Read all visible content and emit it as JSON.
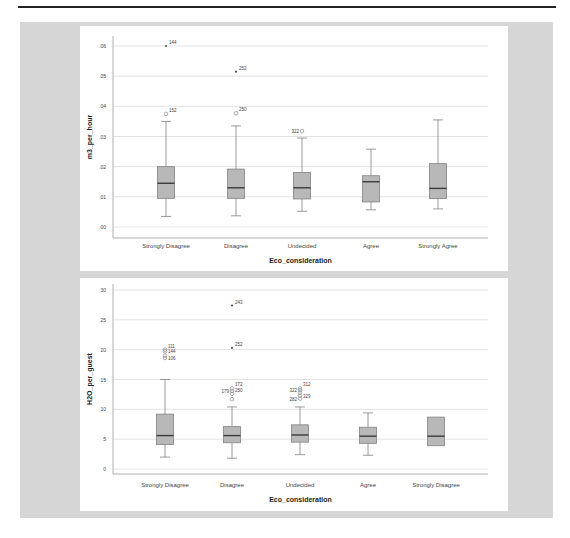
{
  "chart_data": [
    {
      "type": "boxplot",
      "title": "",
      "xlabel": "Eco_consideration",
      "ylabel": "m3_per_hour",
      "yticks": [
        ".00",
        ".01",
        ".02",
        ".03",
        ".04",
        ".05",
        ".06"
      ],
      "ylim": [
        -0.002,
        0.062
      ],
      "grid": true,
      "categories": [
        "Strongly Disagree",
        "Disagree",
        "Undecided",
        "Agree",
        "Strongly Agree"
      ],
      "boxes": [
        {
          "min": 0.0035,
          "q1": 0.0095,
          "median": 0.0145,
          "q3": 0.02,
          "max": 0.035,
          "outliers": [
            {
              "value": 0.0375,
              "label": "152",
              "type": "circle"
            },
            {
              "value": 0.06,
              "label": "144",
              "type": "star"
            }
          ]
        },
        {
          "min": 0.0037,
          "q1": 0.0095,
          "median": 0.013,
          "q3": 0.0192,
          "max": 0.0335,
          "outliers": [
            {
              "value": 0.0377,
              "label": "250",
              "type": "circle"
            },
            {
              "value": 0.0515,
              "label": "252",
              "type": "star"
            }
          ]
        },
        {
          "min": 0.0052,
          "q1": 0.0093,
          "median": 0.013,
          "q3": 0.0181,
          "max": 0.0295,
          "outliers": [
            {
              "value": 0.0318,
              "label": "322",
              "type": "circle"
            }
          ]
        },
        {
          "min": 0.0057,
          "q1": 0.0083,
          "median": 0.015,
          "q3": 0.017,
          "max": 0.0258,
          "outliers": []
        },
        {
          "min": 0.006,
          "q1": 0.0094,
          "median": 0.0128,
          "q3": 0.021,
          "max": 0.0355,
          "outliers": []
        }
      ]
    },
    {
      "type": "boxplot",
      "title": "",
      "xlabel": "Eco_consideration",
      "ylabel": "H2O_per_guest",
      "yticks": [
        "0",
        "5",
        "10",
        "15",
        "20",
        "25",
        "30"
      ],
      "ylim": [
        -1.5,
        31.5
      ],
      "grid": true,
      "categories": [
        "Strongly Disagree",
        "Disagree",
        "Undecided",
        "Agree",
        "Strongly Disagree"
      ],
      "boxes": [
        {
          "min": 2.0,
          "q1": 4.1,
          "median": 5.6,
          "q3": 9.2,
          "max": 15.0,
          "outliers": [
            {
              "value": 18.6,
              "label": "106",
              "type": "circle"
            },
            {
              "value": 19.0,
              "label": "",
              "type": "circle"
            },
            {
              "value": 19.7,
              "label": "144",
              "type": "circle"
            },
            {
              "value": 20.0,
              "label": "111",
              "type": "circle"
            }
          ]
        },
        {
          "min": 1.8,
          "q1": 4.4,
          "median": 5.6,
          "q3": 7.1,
          "max": 10.4,
          "outliers": [
            {
              "value": 11.7,
              "label": "",
              "type": "circle"
            },
            {
              "value": 12.6,
              "label": "250",
              "type": "circle"
            },
            {
              "value": 13.1,
              "label": "179",
              "type": "circle"
            },
            {
              "value": 13.5,
              "label": "172",
              "type": "circle"
            },
            {
              "value": 20.3,
              "label": "252",
              "type": "star"
            },
            {
              "value": 27.4,
              "label": "243",
              "type": "star"
            }
          ]
        },
        {
          "min": 2.4,
          "q1": 4.5,
          "median": 5.7,
          "q3": 7.4,
          "max": 10.4,
          "outliers": [
            {
              "value": 11.8,
              "label": "282",
              "type": "circle"
            },
            {
              "value": 12.3,
              "label": "329",
              "type": "circle"
            },
            {
              "value": 12.8,
              "label": "",
              "type": "circle"
            },
            {
              "value": 13.2,
              "label": "322",
              "type": "circle"
            },
            {
              "value": 13.5,
              "label": "312",
              "type": "circle"
            }
          ]
        },
        {
          "min": 2.3,
          "q1": 4.3,
          "median": 5.5,
          "q3": 7.0,
          "max": 9.4,
          "outliers": []
        },
        {
          "min": 3.9,
          "q1": 3.9,
          "median": 5.5,
          "q3": 8.7,
          "max": 8.7,
          "outliers": []
        }
      ]
    }
  ],
  "colors": {
    "frame_bg": "#d6d6d6",
    "panel_bg": "#ffffff",
    "box_fill": "#b8b8b8",
    "box_stroke": "#808080",
    "median": "#3a3a3a",
    "grid": "#e2e2e2",
    "axis": "#b0b0b0",
    "text": "#444444"
  }
}
